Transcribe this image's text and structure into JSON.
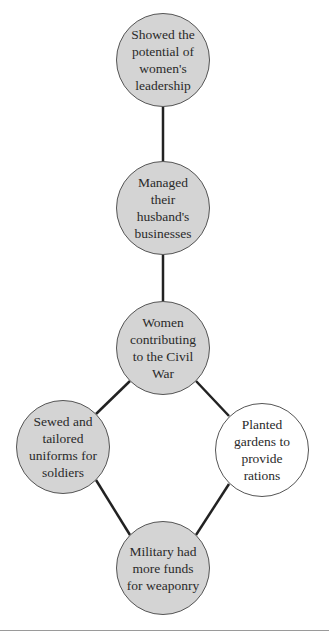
{
  "diagram": {
    "type": "concept-map",
    "colors": {
      "filled_node": "#d4d4d4",
      "unfilled_node": "#ffffff",
      "edge": "#222222",
      "border": "#555555"
    },
    "nodes": [
      {
        "id": "n1",
        "label": "Showed the potential of women's leadership",
        "cx": 163,
        "cy": 60,
        "r": 47,
        "filled": true
      },
      {
        "id": "n2",
        "label": "Managed their husband's businesses",
        "cx": 163,
        "cy": 208,
        "r": 47,
        "filled": true
      },
      {
        "id": "n3",
        "label": "Women contributing to the Civil War",
        "cx": 163,
        "cy": 348,
        "r": 47,
        "filled": true
      },
      {
        "id": "n4",
        "label": "Sewed and tailored uniforms for soldiers",
        "cx": 63,
        "cy": 447,
        "r": 47,
        "filled": true
      },
      {
        "id": "n5",
        "label": "Planted gardens to provide rations",
        "cx": 262,
        "cy": 450,
        "r": 47,
        "filled": false
      },
      {
        "id": "n6",
        "label": "Military had more funds for weaponry",
        "cx": 163,
        "cy": 568,
        "r": 47,
        "filled": true
      }
    ],
    "edges": [
      {
        "from": "n1",
        "to": "n2"
      },
      {
        "from": "n2",
        "to": "n3"
      },
      {
        "from": "n3",
        "to": "n4"
      },
      {
        "from": "n3",
        "to": "n5"
      },
      {
        "from": "n4",
        "to": "n6"
      },
      {
        "from": "n5",
        "to": "n6"
      }
    ]
  }
}
